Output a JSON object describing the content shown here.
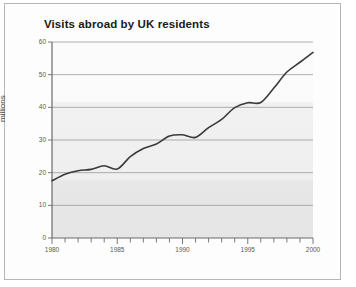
{
  "figure": {
    "title": "Visits abroad by UK residents"
  },
  "chart_data": {
    "type": "line",
    "title": "Visits abroad by UK residents",
    "xlabel": "",
    "ylabel": "millions",
    "xlim": [
      1980,
      2000
    ],
    "ylim": [
      0,
      60
    ],
    "grid": true,
    "legend": null,
    "y_ticks": [
      0,
      10,
      20,
      30,
      40,
      50,
      60
    ],
    "y_tick_labels": [
      "0",
      "10",
      "20",
      "30",
      "40",
      "50",
      "60"
    ],
    "x_ticks": [
      1980,
      1985,
      1990,
      1995,
      2000
    ],
    "x_tick_labels": [
      "1980",
      "1985",
      "1990",
      "1995",
      "2000"
    ],
    "x_minor_tick_interval": 1,
    "series": [
      {
        "name": "Visits abroad",
        "color": "#3a3a3a",
        "x": [
          1980,
          1981,
          1982,
          1983,
          1984,
          1985,
          1986,
          1987,
          1988,
          1989,
          1990,
          1991,
          1992,
          1993,
          1994,
          1995,
          1996,
          1997,
          1998,
          1999,
          2000
        ],
        "values": [
          17.5,
          19.5,
          20.6,
          21.0,
          22.1,
          21.1,
          24.9,
          27.4,
          28.8,
          31.2,
          31.6,
          30.8,
          33.8,
          36.3,
          39.9,
          41.4,
          41.5,
          45.9,
          50.8,
          53.8,
          56.8
        ]
      }
    ]
  }
}
